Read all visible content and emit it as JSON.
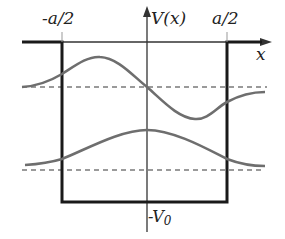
{
  "diagram": {
    "labels": {
      "left_edge": "-a/2",
      "right_edge": "a/2",
      "y_axis": "V(x)",
      "x_axis": "x",
      "depth": "-V",
      "depth_sub": "0"
    },
    "colors": {
      "well": "#1a1a1a",
      "axis": "#333333",
      "wavefunction": "#6e6e6e",
      "energy_level": "#9a9a9a"
    },
    "wavefunctions": [
      {
        "name": "first-excited-state",
        "shape": "odd",
        "energy_level_y": 87
      },
      {
        "name": "ground-state",
        "shape": "even",
        "energy_level_y": 170
      }
    ]
  }
}
